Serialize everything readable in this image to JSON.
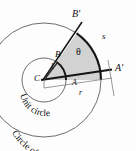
{
  "figure": {
    "background": "#fdfdfd",
    "stroke_color": "#1a1a1a",
    "sector_fill": "#d2d2d2",
    "thin_line_color": "#6f6f6f"
  },
  "labels": {
    "b_prime": "B'",
    "a_prime": "A'",
    "b": "B",
    "a": "A",
    "c": "C",
    "s": "s",
    "theta": "θ",
    "one": "1",
    "r": "r",
    "unit_circle": "Unit circle",
    "circle_of_radius": "Circle of radius r"
  },
  "geometry": {
    "center": {
      "x": 44,
      "y": 80
    },
    "unit_radius": 22,
    "outer_radius": 57,
    "angle_start_deg": 0,
    "angle_end_deg": 55,
    "sector_shaded": true
  }
}
